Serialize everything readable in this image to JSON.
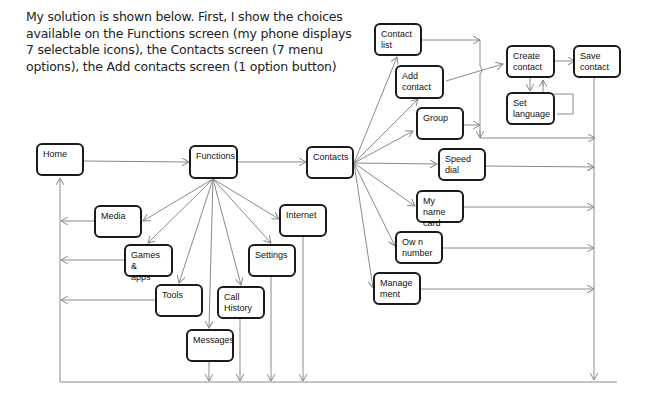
{
  "intro": {
    "lines": [
      "My solution is shown below. First, I show the choices",
      "available on the Functions screen (my phone displays",
      "7 selectable icons), the Contacts screen (7 menu",
      "options), the Add contacts screen (1 option button)"
    ]
  },
  "nodes": {
    "home": "Home",
    "functions": "Functions",
    "contacts": "Contacts",
    "media": "Media",
    "games_apps": "Games &\napps",
    "tools": "Tools",
    "messages": "Messages",
    "call_history": "Call\nHistory",
    "settings": "Settings",
    "internet": "Internet",
    "contact_list": "Contact\nlist",
    "add_contact": "Add\ncontact",
    "group": "Group",
    "speed_dial": "Speed\ndial",
    "my_name_card": "My name\ncard",
    "own_number": "Ow n\nnumber",
    "management": "Manage\nment",
    "create_contact": "Create\ncontact",
    "set_language": "Set\nlanguage",
    "save_contact": "Save\ncontact"
  },
  "colors": {
    "node_border": "#1a1a1a",
    "edge": "#8a8a8a",
    "text": "#222222"
  }
}
